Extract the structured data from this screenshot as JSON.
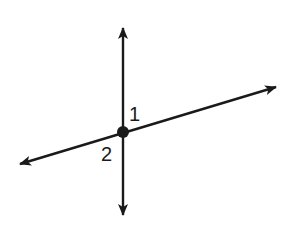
{
  "diagram": {
    "colors": {
      "stroke": "#1a1a1a",
      "background": "#ffffff"
    },
    "lines": [
      {
        "name": "vertical-line",
        "from": [
          123,
          28
        ],
        "to": [
          123,
          215
        ]
      },
      {
        "name": "slanted-line",
        "from": [
          20,
          164
        ],
        "to": [
          276,
          87
        ]
      }
    ],
    "intersection_point": [
      123,
      132
    ],
    "angle_labels": [
      {
        "id": "1",
        "text": "1"
      },
      {
        "id": "2",
        "text": "2"
      }
    ]
  }
}
